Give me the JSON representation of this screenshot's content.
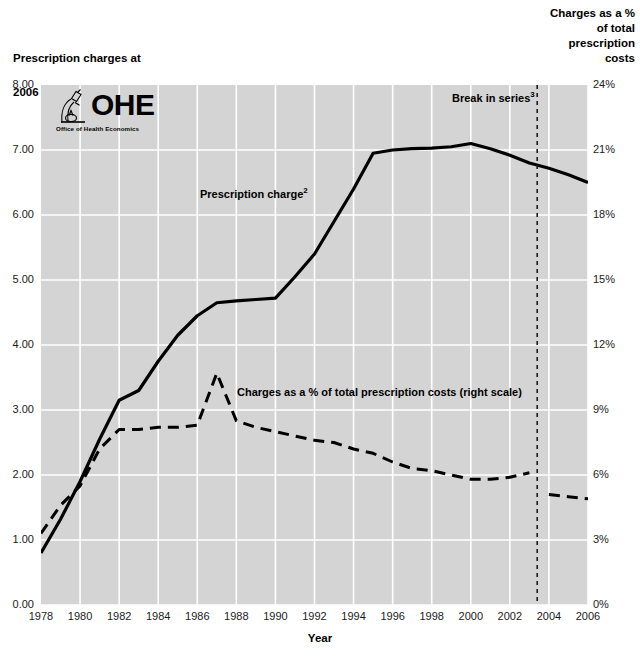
{
  "axes": {
    "left_title_line1": "Prescription charges at",
    "left_title_line2": "2006 prices",
    "left_title_sup": "1",
    "left_title_unit": " (£)",
    "right_title": "Charges as a %\nof total\nprescription\ncosts",
    "x_title": "Year"
  },
  "logo": {
    "wordmark": "OHE",
    "subtitle": "Office of Health Economics",
    "icon": "ohe-microscope-icon"
  },
  "annotations": {
    "series_solid": "Prescription charge",
    "series_solid_sup": "2",
    "series_dashed": "Charges as a % of total prescription costs (right scale)",
    "break": "Break in series",
    "break_sup": "3"
  },
  "colors": {
    "plot_background": "#d4d4d4",
    "gridline": "#ffffff",
    "line": "#000000",
    "text": "#000000"
  },
  "chart_data": {
    "type": "line",
    "title": "",
    "xlabel": "Year",
    "ylabel": "Prescription charges at 2006 prices (£)",
    "y2label": "Charges as a % of total prescription costs",
    "grid": true,
    "legend_position": "inline-annotations",
    "xlim": [
      1978,
      2006
    ],
    "xticks": [
      1978,
      1980,
      1982,
      1984,
      1986,
      1988,
      1990,
      1992,
      1994,
      1996,
      1998,
      2000,
      2002,
      2004,
      2006
    ],
    "ylim": [
      0.0,
      8.0
    ],
    "yticks": [
      "0.00",
      "1.00",
      "2.00",
      "3.00",
      "4.00",
      "5.00",
      "6.00",
      "7.00",
      "8.00"
    ],
    "y2lim": [
      0,
      24
    ],
    "y2ticks": [
      "0%",
      "3%",
      "6%",
      "9%",
      "12%",
      "15%",
      "18%",
      "21%",
      "24%"
    ],
    "x": [
      1978,
      1979,
      1980,
      1981,
      1982,
      1983,
      1984,
      1985,
      1986,
      1987,
      1988,
      1989,
      1990,
      1991,
      1992,
      1993,
      1994,
      1995,
      1996,
      1997,
      1998,
      1999,
      2000,
      2001,
      2002,
      2003,
      2004,
      2005,
      2006
    ],
    "series": [
      {
        "name": "Prescription charge",
        "axis": "left",
        "style": "solid",
        "values": [
          0.8,
          1.32,
          1.9,
          2.55,
          3.15,
          3.3,
          3.75,
          4.15,
          4.45,
          4.65,
          4.68,
          4.7,
          4.72,
          5.05,
          5.4,
          5.9,
          6.4,
          6.95,
          7.0,
          7.02,
          7.03,
          7.05,
          7.1,
          7.02,
          6.92,
          6.8,
          6.72,
          6.62,
          6.5
        ]
      },
      {
        "name": "Charges as a % of total prescription costs",
        "axis": "right",
        "style": "dashed",
        "values": [
          3.3,
          4.6,
          5.5,
          7.2,
          8.1,
          8.1,
          8.2,
          8.2,
          8.3,
          10.7,
          8.5,
          8.2,
          8.0,
          7.8,
          7.6,
          7.5,
          7.2,
          7.0,
          6.6,
          6.3,
          6.2,
          6.0,
          5.8,
          5.8,
          5.9,
          6.1,
          5.1,
          5.0,
          4.9
        ]
      }
    ],
    "break_in_series": {
      "year": 2003,
      "label": "Break in series"
    }
  }
}
